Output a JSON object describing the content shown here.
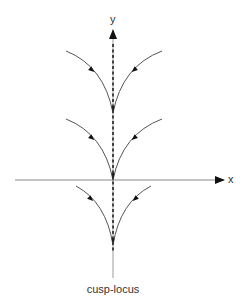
{
  "diagram": {
    "type": "phase-portrait",
    "axes": {
      "x_label": "x",
      "y_label": "y"
    },
    "cusp_locus_label": "cusp-locus",
    "colors": {
      "axis": "#888888",
      "curve": "#555555",
      "dashed_locus": "#222222",
      "arrowhead": "#111111",
      "text": "#333333"
    },
    "cusp_families": [
      {
        "name": "upper",
        "cusp_point": [
          113,
          113
        ],
        "left_start": [
          66,
          51
        ],
        "right_start": [
          162,
          51
        ]
      },
      {
        "name": "middle",
        "cusp_point": [
          113,
          180
        ],
        "left_start": [
          66,
          119
        ],
        "right_start": [
          162,
          119
        ]
      },
      {
        "name": "lower",
        "cusp_point": [
          113,
          245
        ],
        "left_start": [
          76,
          186
        ],
        "right_start": [
          151,
          186
        ]
      }
    ],
    "flow_direction": "toward cusp along each branch"
  }
}
